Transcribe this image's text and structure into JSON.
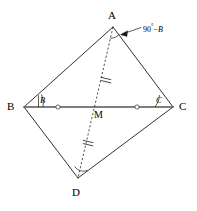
{
  "figure": {
    "type": "geometry-diagram",
    "width": 197,
    "height": 211,
    "stroke_color": "#1a1a1a",
    "segment_bc_color": "#7a7a7a",
    "background": "#ffffff"
  },
  "vertices": {
    "a": {
      "label": "A",
      "x": 113,
      "y": 27,
      "label_x": 108,
      "label_y": 10
    },
    "b": {
      "label": "B",
      "x": 24,
      "y": 107,
      "label_x": 7,
      "label_y": 101
    },
    "c": {
      "label": "C",
      "x": 173,
      "y": 107,
      "label_x": 179,
      "label_y": 101
    },
    "d": {
      "label": "D",
      "x": 78,
      "y": 178,
      "label_x": 72,
      "label_y": 187
    },
    "m": {
      "label": "M",
      "x": 98,
      "y": 107,
      "label_x": 94,
      "label_y": 110
    }
  },
  "angle_labels": {
    "at_b": {
      "text": "B",
      "x": 40,
      "y": 96
    },
    "at_c": {
      "text": "C",
      "x": 156,
      "y": 96
    }
  },
  "annotations": {
    "angle_a": {
      "text_degrees": "90",
      "degree_symbol": "°",
      "minus": "−",
      "text_variable": "B",
      "full_text": "90°−B",
      "x": 143,
      "y": 23
    }
  },
  "congruence_marks": {
    "bc_midpoint_marks": [
      {
        "name": "bm-tick",
        "x": 58,
        "y": 107
      },
      {
        "name": "mc-tick",
        "x": 137,
        "y": 107
      }
    ],
    "ad_marks": [
      {
        "name": "am-tick",
        "x": 106,
        "y": 79
      },
      {
        "name": "md-tick",
        "x": 88,
        "y": 142
      }
    ]
  },
  "segments": [
    {
      "name": "ab",
      "from": "a",
      "to": "b",
      "style": "solid"
    },
    {
      "name": "ac",
      "from": "a",
      "to": "c",
      "style": "solid"
    },
    {
      "name": "bd",
      "from": "b",
      "to": "d",
      "style": "solid"
    },
    {
      "name": "cd",
      "from": "c",
      "to": "d",
      "style": "solid"
    },
    {
      "name": "bc",
      "from": "b",
      "to": "c",
      "style": "solid-gray"
    },
    {
      "name": "ad",
      "from": "a",
      "to": "d",
      "style": "dashed"
    }
  ]
}
